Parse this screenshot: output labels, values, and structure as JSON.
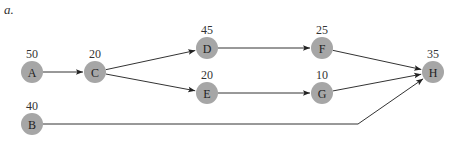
{
  "figure": {
    "part_label": "a.",
    "nodes": [
      {
        "id": "A",
        "label": "A",
        "weight": "50",
        "x": 32,
        "y": 72
      },
      {
        "id": "B",
        "label": "B",
        "weight": "40",
        "x": 32,
        "y": 124
      },
      {
        "id": "C",
        "label": "C",
        "weight": "20",
        "x": 95,
        "y": 72
      },
      {
        "id": "D",
        "label": "D",
        "weight": "45",
        "x": 207,
        "y": 48
      },
      {
        "id": "E",
        "label": "E",
        "weight": "20",
        "x": 207,
        "y": 93
      },
      {
        "id": "F",
        "label": "F",
        "weight": "25",
        "x": 322,
        "y": 48
      },
      {
        "id": "G",
        "label": "G",
        "weight": "10",
        "x": 322,
        "y": 93
      },
      {
        "id": "H",
        "label": "H",
        "weight": "35",
        "x": 433,
        "y": 72
      }
    ],
    "edges": [
      {
        "from": "A",
        "to": "C"
      },
      {
        "from": "C",
        "to": "D"
      },
      {
        "from": "C",
        "to": "E"
      },
      {
        "from": "D",
        "to": "F"
      },
      {
        "from": "E",
        "to": "G"
      },
      {
        "from": "F",
        "to": "H"
      },
      {
        "from": "G",
        "to": "H"
      },
      {
        "from": "B",
        "to": "H",
        "via": [
          358,
          124
        ]
      }
    ],
    "colors": {
      "node_fill": "#a6a6a6",
      "edge": "#333333",
      "text": "#222222"
    }
  }
}
